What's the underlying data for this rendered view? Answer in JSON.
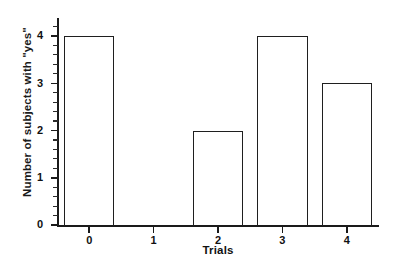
{
  "chart_data": {
    "type": "bar",
    "title": "",
    "xlabel": "Trials",
    "ylabel": "Number of subjects with \"yes\"",
    "categories": [
      "0",
      "1",
      "2",
      "3",
      "4"
    ],
    "values": [
      4,
      0,
      2,
      4,
      3
    ],
    "ylim": [
      0,
      4
    ],
    "xlim": [
      -0.5,
      4.5
    ],
    "ytick_labels": [
      "0",
      "1",
      "2",
      "3",
      "4"
    ],
    "ytick_values": [
      0,
      1,
      2,
      3,
      4
    ],
    "yminor_count_between": 4,
    "xtick_labels": [
      "0",
      "1",
      "2",
      "3",
      "4"
    ],
    "xtick_values": [
      0,
      1,
      2,
      3,
      4
    ],
    "grid": false,
    "legend": null,
    "bar_style": "outline",
    "bar_fill": "#ffffff",
    "bar_edge_color": "#1f1f1f",
    "axis_color": "#1a1a1a",
    "background": "#ffffff",
    "text_color": "#111111",
    "bar_width_fraction": 0.78
  }
}
